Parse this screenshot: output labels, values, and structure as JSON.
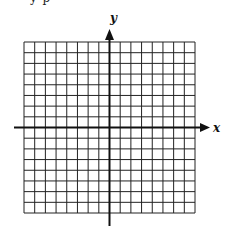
{
  "figure": {
    "type": "coordinate-grid",
    "top_text_cut": "y  p",
    "x_axis_label": "x",
    "y_axis_label": "y",
    "grid": {
      "columns": 16,
      "rows": 16,
      "left": 24,
      "top": 42,
      "size": 171
    },
    "colors": {
      "line": "#222222",
      "background": "#ffffff"
    }
  }
}
